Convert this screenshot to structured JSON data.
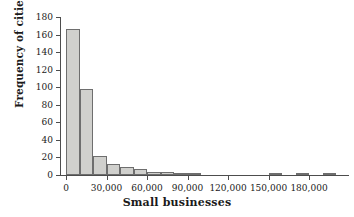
{
  "chart_data": {
    "type": "bar",
    "title": "",
    "xlabel": "Small businesses",
    "ylabel": "Frequency of cities",
    "xlim": [
      0,
      200000
    ],
    "ylim": [
      0,
      180
    ],
    "grid": false,
    "legend": null,
    "bin_width": 10000,
    "xticks": [
      0,
      30000,
      60000,
      90000,
      120000,
      150000,
      180000
    ],
    "xtick_labels": [
      "0",
      "30,000",
      "60,000",
      "90,000",
      "120,000",
      "150,000",
      "180,000"
    ],
    "yticks": [
      0,
      20,
      40,
      60,
      80,
      100,
      120,
      140,
      160,
      180
    ],
    "ytick_labels": [
      "0",
      "20",
      "40",
      "60",
      "80",
      "100",
      "120",
      "140",
      "160",
      "180"
    ],
    "bin_starts": [
      0,
      10000,
      20000,
      30000,
      40000,
      50000,
      60000,
      70000,
      80000,
      90000,
      100000,
      110000,
      120000,
      130000,
      140000,
      150000,
      160000,
      170000,
      180000,
      190000
    ],
    "values": [
      166,
      98,
      22,
      12,
      9,
      7,
      4,
      3,
      2,
      2,
      0,
      0,
      0,
      0,
      0,
      2,
      0,
      2,
      0,
      2
    ]
  },
  "bars": [
    {
      "start": 0,
      "value": 166,
      "label": "0–10,000"
    },
    {
      "start": 10000,
      "value": 98,
      "label": "10,000–20,000"
    },
    {
      "start": 20000,
      "value": 22,
      "label": "20,000–30,000"
    },
    {
      "start": 30000,
      "value": 12,
      "label": "30,000–40,000"
    },
    {
      "start": 40000,
      "value": 9,
      "label": "40,000–50,000"
    },
    {
      "start": 50000,
      "value": 7,
      "label": "50,000–60,000"
    },
    {
      "start": 60000,
      "value": 4,
      "label": "60,000–70,000"
    },
    {
      "start": 70000,
      "value": 3,
      "label": "70,000–80,000"
    },
    {
      "start": 80000,
      "value": 2,
      "label": "80,000–90,000"
    },
    {
      "start": 90000,
      "value": 2,
      "label": "90,000–100,000"
    },
    {
      "start": 150000,
      "value": 2,
      "label": "150,000–160,000"
    },
    {
      "start": 170000,
      "value": 2,
      "label": "170,000–180,000"
    },
    {
      "start": 190000,
      "value": 2,
      "label": "190,000–200,000"
    }
  ],
  "colors": {
    "bar_fill": "#d0d0cd",
    "bar_stroke": "#6e6e6e",
    "axis": "#4d4d4d",
    "text": "#1a1a1a",
    "background": "#ffffff"
  }
}
